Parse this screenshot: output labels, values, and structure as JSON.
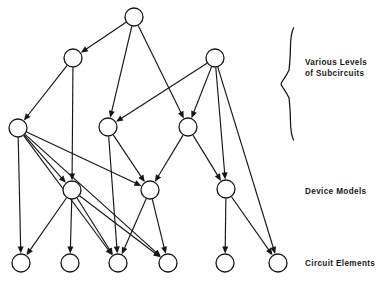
{
  "diagram": {
    "background_color": "#ffffff",
    "stroke_color": "#161616",
    "node_radius": 9,
    "labels": [
      {
        "id": "subcircuits",
        "text": "Various Levels\nof Subcircuits",
        "x": 305,
        "y": 57
      },
      {
        "id": "device-models",
        "text": "Device Models",
        "x": 305,
        "y": 186
      },
      {
        "id": "circuit-elements",
        "text": "Circuit Elements",
        "x": 305,
        "y": 258
      }
    ],
    "brace": {
      "name": "curly-brace",
      "x": 288,
      "y_top": 28,
      "y_bottom": 140
    },
    "nodes": [
      {
        "id": "n0",
        "level": 0,
        "x": 134,
        "y": 17,
        "r": 9
      },
      {
        "id": "n1",
        "level": 1,
        "x": 73,
        "y": 58,
        "r": 9
      },
      {
        "id": "n2",
        "level": 1,
        "x": 215,
        "y": 58,
        "r": 9
      },
      {
        "id": "n3",
        "level": 2,
        "x": 18,
        "y": 128,
        "r": 9
      },
      {
        "id": "n4",
        "level": 2,
        "x": 108,
        "y": 127,
        "r": 9
      },
      {
        "id": "n5",
        "level": 2,
        "x": 188,
        "y": 127,
        "r": 9
      },
      {
        "id": "n6",
        "level": 3,
        "x": 72,
        "y": 190,
        "r": 9
      },
      {
        "id": "n7",
        "level": 3,
        "x": 150,
        "y": 190,
        "r": 9
      },
      {
        "id": "n8",
        "level": 3,
        "x": 226,
        "y": 189,
        "r": 9
      },
      {
        "id": "n9",
        "level": 4,
        "x": 21,
        "y": 263,
        "r": 9
      },
      {
        "id": "n10",
        "level": 4,
        "x": 70,
        "y": 263,
        "r": 9
      },
      {
        "id": "n11",
        "level": 4,
        "x": 118,
        "y": 263,
        "r": 9
      },
      {
        "id": "n12",
        "level": 4,
        "x": 168,
        "y": 263,
        "r": 9
      },
      {
        "id": "n13",
        "level": 4,
        "x": 225,
        "y": 263,
        "r": 9
      },
      {
        "id": "n14",
        "level": 4,
        "x": 278,
        "y": 263,
        "r": 9
      }
    ],
    "edges": [
      {
        "from": "n0",
        "to": "n1"
      },
      {
        "from": "n0",
        "to": "n4"
      },
      {
        "from": "n0",
        "to": "n5"
      },
      {
        "from": "n1",
        "to": "n3"
      },
      {
        "from": "n1",
        "to": "n6"
      },
      {
        "from": "n2",
        "to": "n4"
      },
      {
        "from": "n2",
        "to": "n5"
      },
      {
        "from": "n2",
        "to": "n8"
      },
      {
        "from": "n2",
        "to": "n14"
      },
      {
        "from": "n3",
        "to": "n9"
      },
      {
        "from": "n3",
        "to": "n6"
      },
      {
        "from": "n3",
        "to": "n7"
      },
      {
        "from": "n3",
        "to": "n11"
      },
      {
        "from": "n3",
        "to": "n12"
      },
      {
        "from": "n4",
        "to": "n7"
      },
      {
        "from": "n4",
        "to": "n11"
      },
      {
        "from": "n5",
        "to": "n7"
      },
      {
        "from": "n5",
        "to": "n8"
      },
      {
        "from": "n6",
        "to": "n9"
      },
      {
        "from": "n6",
        "to": "n10"
      },
      {
        "from": "n6",
        "to": "n11"
      },
      {
        "from": "n6",
        "to": "n12"
      },
      {
        "from": "n7",
        "to": "n11"
      },
      {
        "from": "n7",
        "to": "n12"
      },
      {
        "from": "n8",
        "to": "n13"
      },
      {
        "from": "n8",
        "to": "n14"
      }
    ]
  }
}
